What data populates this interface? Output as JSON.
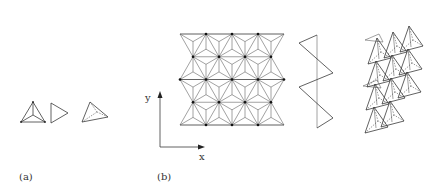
{
  "panels": [
    {
      "id": "a",
      "label": "(a)",
      "description": "Three views of a tetrahedron"
    },
    {
      "id": "b",
      "label": "(b)",
      "description": "Layer of corner-sharing tetrahedra in plan, zigzag chain profile, and perspective stack",
      "axes": {
        "x_label": "x",
        "y_label": "y"
      },
      "grid": {
        "rows": 4,
        "cols": 4
      }
    }
  ],
  "colors": {
    "line": "#3a3a3a",
    "shade": "#8a8a8a",
    "background": "#ffffff"
  }
}
